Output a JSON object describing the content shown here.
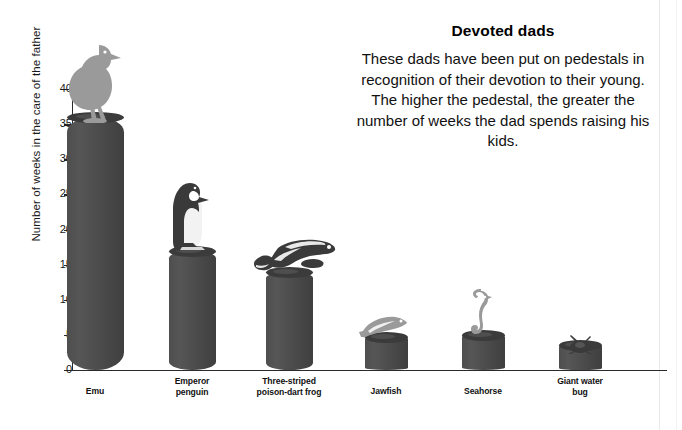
{
  "panel": {
    "title": "Devoted dads",
    "body": "These dads have been put on pedestals in recognition of their devotion to their young. The higher the pedestal, the greater the number of weeks the dad spends raising his kids."
  },
  "axis": {
    "y_title": "Number of weeks in the care of the father",
    "ticks": [
      "0",
      "5",
      "10",
      "15",
      "20",
      "25",
      "30",
      "35",
      "40"
    ]
  },
  "bars": [
    {
      "label": "Emu",
      "value": 36,
      "icon": "emu-icon"
    },
    {
      "label": "Emperor\npenguin",
      "value": 17,
      "icon": "emperor-penguin-icon"
    },
    {
      "label": "Three-striped\npoison-dart frog",
      "value": 14,
      "icon": "poison-dart-frog-icon"
    },
    {
      "label": "Jawfish",
      "value": 4.7,
      "icon": "jawfish-icon"
    },
    {
      "label": "Seahorse",
      "value": 5,
      "icon": "seahorse-icon"
    },
    {
      "label": "Giant water\nbug",
      "value": 3.5,
      "icon": "giant-water-bug-icon"
    }
  ],
  "colors": {
    "pedestal": "#4a4a4a",
    "pedestal_top": "#3b3b3b",
    "axis": "#2a2a2a",
    "text": "#111111",
    "animal_light": "#9a9a9a",
    "animal_dark": "#3a3a3a"
  },
  "chart_data": {
    "type": "bar",
    "title": "Devoted dads",
    "xlabel": "",
    "ylabel": "Number of weeks in the care of the father",
    "ylim": [
      0,
      40
    ],
    "yticks": [
      0,
      5,
      10,
      15,
      20,
      25,
      30,
      35,
      40
    ],
    "grid": false,
    "legend": "none",
    "categories": [
      "Emu",
      "Emperor penguin",
      "Three-striped poison-dart frog",
      "Jawfish",
      "Seahorse",
      "Giant water bug"
    ],
    "values": [
      36,
      17,
      14,
      4.7,
      5,
      3.5
    ],
    "annotations": [
      "These dads have been put on pedestals in recognition of their devotion to their young. The higher the pedestal, the greater the number of weeks the dad spends raising his kids."
    ]
  }
}
